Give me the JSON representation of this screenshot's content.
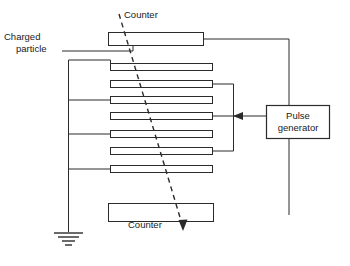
{
  "diagram": {
    "background_color": "#ffffff",
    "line_color": "#2b2b2b",
    "labels": {
      "counter_top": "Counter",
      "counter_bottom": "Counter",
      "charged_particle_line1": "Charged",
      "charged_particle_line2": "particle",
      "pulse_generator_line1": "Pulse",
      "pulse_generator_line2": "generator"
    },
    "counters": [
      {
        "name": "counter-top",
        "x": 108,
        "y": 32,
        "width": 95,
        "height": 13
      },
      {
        "name": "counter-bottom",
        "x": 108,
        "y": 203,
        "width": 105,
        "height": 18
      }
    ],
    "plates": [
      {
        "index": 1,
        "x": 110,
        "y": 63,
        "width": 102,
        "height": 8,
        "bus": "left"
      },
      {
        "index": 2,
        "x": 110,
        "y": 80,
        "width": 102,
        "height": 8,
        "bus": "right"
      },
      {
        "index": 3,
        "x": 110,
        "y": 96,
        "width": 102,
        "height": 8,
        "bus": "left"
      },
      {
        "index": 4,
        "x": 110,
        "y": 112,
        "width": 102,
        "height": 8,
        "bus": "right"
      },
      {
        "index": 5,
        "x": 110,
        "y": 130,
        "width": 102,
        "height": 8,
        "bus": "left"
      },
      {
        "index": 6,
        "x": 110,
        "y": 147,
        "width": 102,
        "height": 8,
        "bus": "right"
      },
      {
        "index": 7,
        "x": 110,
        "y": 165,
        "width": 102,
        "height": 8,
        "bus": "left"
      }
    ],
    "pulse_generator_box": {
      "x": 266,
      "y": 105,
      "width": 64,
      "height": 34
    },
    "left_bus": {
      "x": 68,
      "y_top": 60,
      "y_bottom": 232
    },
    "right_bus": {
      "x": 233,
      "y_top": 84,
      "y_bottom": 151
    },
    "ground": {
      "x": 68,
      "y": 232,
      "bars": 4
    },
    "trajectory": {
      "x1": 119,
      "y1": 14,
      "x2": 184,
      "y2": 230,
      "style": "dashed",
      "arrow": "down"
    },
    "pulse_feed_wire": {
      "from_x": 203,
      "from_y": 38,
      "corner_x": 289,
      "to_y": 215
    },
    "arrow_into_plates": {
      "x": 233,
      "y": 116,
      "direction": "left"
    }
  }
}
